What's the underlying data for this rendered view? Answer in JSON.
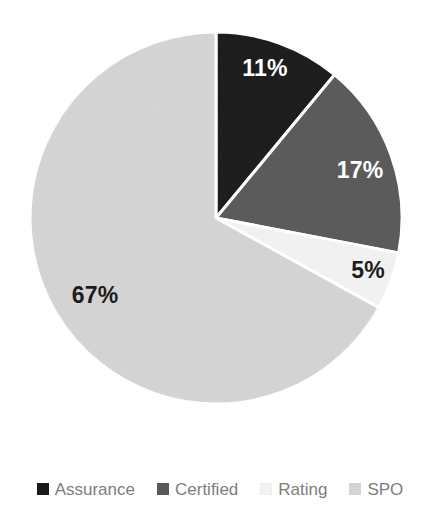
{
  "chart_data": {
    "type": "pie",
    "title": "",
    "subtitle": "",
    "xlabel": "",
    "ylabel": "",
    "categories": [
      "Assurance",
      "Certified",
      "Rating",
      "SPO"
    ],
    "values": [
      11,
      17,
      5,
      67
    ],
    "value_unit": "%",
    "data_labels": [
      "11%",
      "17%",
      "5%",
      "67%"
    ],
    "colors": [
      "#1a1a1a",
      "#595959",
      "#f2f2f2",
      "#d4d4d4"
    ],
    "label_colors": [
      "#ffffff",
      "#ffffff",
      "#1c1c1c",
      "#1c1c1c"
    ],
    "start_angle_deg": 0,
    "direction": "clockwise",
    "slice_border_color": "#ffffff",
    "slice_border_width": 3,
    "grid": false,
    "legend_position": "bottom",
    "legend": [
      {
        "label": "Assurance",
        "color": "#1a1a1a",
        "value": 11,
        "data_label": "11%"
      },
      {
        "label": "Certified",
        "color": "#595959",
        "value": 17,
        "data_label": "17%"
      },
      {
        "label": "Rating",
        "color": "#f2f2f2",
        "value": 5,
        "data_label": "5%"
      },
      {
        "label": "SPO",
        "color": "#d4d4d4",
        "value": 67,
        "data_label": "67%"
      }
    ]
  },
  "pie": {
    "center_x": 216,
    "center_y": 218,
    "radius": 186,
    "slices": [
      {
        "name": "Assurance",
        "data_label": "11%",
        "label_x": 265,
        "label_y": 70,
        "label_tone": "light"
      },
      {
        "name": "Certified",
        "data_label": "17%",
        "label_x": 360,
        "label_y": 172,
        "label_tone": "light"
      },
      {
        "name": "Rating",
        "data_label": "5%",
        "label_x": 368,
        "label_y": 272,
        "label_tone": "dark"
      },
      {
        "name": "SPO",
        "data_label": "67%",
        "label_x": 95,
        "label_y": 297,
        "label_tone": "dark"
      }
    ]
  },
  "legend_labels": {
    "item0": "Assurance",
    "item1": "Certified",
    "item2": "Rating",
    "item3": "SPO"
  }
}
